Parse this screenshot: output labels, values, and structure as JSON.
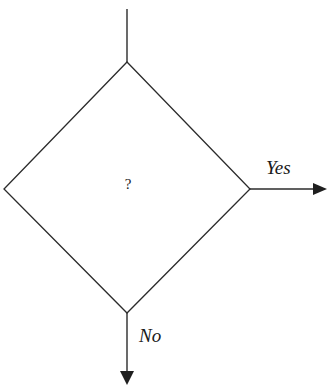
{
  "diagram": {
    "type": "flowchart-decision",
    "background_color": "#ffffff",
    "stroke_color": "#2b2b2b",
    "text_color": "#1a1a1a",
    "decision_node": {
      "label": "?",
      "shape": "diamond",
      "center_x": 127,
      "center_y": 188,
      "top": {
        "x": 127,
        "y": 62
      },
      "right": {
        "x": 250,
        "y": 189
      },
      "bottom": {
        "x": 127,
        "y": 313
      },
      "left": {
        "x": 4,
        "y": 189
      }
    },
    "edges": [
      {
        "name": "input-edge",
        "label": "",
        "from_x": 127,
        "from_y": 9,
        "to_x": 127,
        "to_y": 62,
        "arrowhead": false
      },
      {
        "name": "yes-edge",
        "label": "Yes",
        "from_x": 250,
        "from_y": 189,
        "to_x": 327,
        "to_y": 189,
        "arrowhead": true,
        "direction": "right",
        "label_x": 286,
        "label_y": 174
      },
      {
        "name": "no-edge",
        "label": "No",
        "from_x": 127,
        "from_y": 313,
        "to_x": 127,
        "to_y": 385,
        "arrowhead": true,
        "direction": "down",
        "label_x": 155,
        "label_y": 342
      }
    ]
  }
}
